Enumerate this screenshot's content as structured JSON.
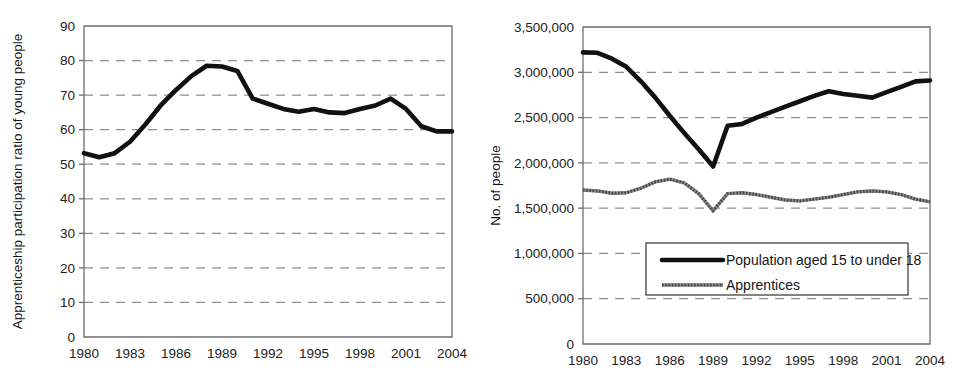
{
  "figure": {
    "background_color": "#ffffff",
    "ink_color": "#111111",
    "grid_color": "#8d8d8d",
    "axis_color": "#6e6e6e"
  },
  "chart_data": [
    {
      "id": "left",
      "type": "line",
      "title": "",
      "xlabel": "",
      "ylabel": "Apprenticeship participation ratio of young people",
      "xlim": [
        1980,
        2004
      ],
      "ylim": [
        0,
        90
      ],
      "ytick_labels": [
        "90",
        "80",
        "70",
        "60",
        "50",
        "40",
        "30",
        "20",
        "10",
        "0"
      ],
      "ytick_values": [
        90,
        80,
        70,
        60,
        50,
        40,
        30,
        20,
        10,
        0
      ],
      "xtick_labels": [
        "1980",
        "1983",
        "1986",
        "1989",
        "1992",
        "1995",
        "1998",
        "2001",
        "2004"
      ],
      "xtick_values": [
        1980,
        1983,
        1986,
        1989,
        1992,
        1995,
        1998,
        2001,
        2004
      ],
      "grid": "horizontal-dashed",
      "legend": "none",
      "x": [
        1980,
        1981,
        1982,
        1983,
        1984,
        1985,
        1986,
        1987,
        1988,
        1989,
        1990,
        1991,
        1992,
        1993,
        1994,
        1995,
        1996,
        1997,
        1998,
        1999,
        2000,
        2001,
        2002,
        2003,
        2004
      ],
      "series": [
        {
          "name": "Apprenticeship participation ratio of young people",
          "style": "thick-solid",
          "values": [
            53.2,
            52.0,
            53.2,
            56.5,
            61.5,
            67.0,
            71.5,
            75.5,
            78.5,
            78.3,
            77.0,
            69.0,
            67.5,
            66.0,
            65.2,
            66.0,
            65.0,
            64.8,
            66.0,
            67.0,
            69.0,
            66.0,
            61.0,
            59.5,
            59.5
          ]
        }
      ]
    },
    {
      "id": "right",
      "type": "line",
      "title": "",
      "xlabel": "",
      "ylabel": "No. of people",
      "xlim": [
        1980,
        2004
      ],
      "ylim": [
        0,
        3500000
      ],
      "ytick_labels": [
        "3,500,000",
        "3,000,000",
        "2,500,000",
        "2,000,000",
        "1,500,000",
        "1,000,000",
        "500,000",
        "0"
      ],
      "ytick_values": [
        3500000,
        3000000,
        2500000,
        2000000,
        1500000,
        1000000,
        500000,
        0
      ],
      "xtick_labels": [
        "1980",
        "1983",
        "1986",
        "1989",
        "1992",
        "1995",
        "1998",
        "2001",
        "2004"
      ],
      "xtick_values": [
        1980,
        1983,
        1986,
        1989,
        1992,
        1995,
        1998,
        2001,
        2004
      ],
      "grid": "horizontal-dashed",
      "legend": "inside-bottom-center",
      "x": [
        1980,
        1981,
        1982,
        1983,
        1984,
        1985,
        1986,
        1987,
        1988,
        1989,
        1990,
        1991,
        1992,
        1993,
        1994,
        1995,
        1996,
        1997,
        1998,
        1999,
        2000,
        2001,
        2002,
        2003,
        2004
      ],
      "series": [
        {
          "name": "Population aged 15 to under 18",
          "style": "thick-solid",
          "values": [
            3220000,
            3215000,
            3150000,
            3060000,
            2900000,
            2720000,
            2520000,
            2330000,
            2150000,
            1960000,
            2410000,
            2430000,
            2500000,
            2560000,
            2620000,
            2680000,
            2740000,
            2790000,
            2760000,
            2740000,
            2720000,
            2780000,
            2840000,
            2900000,
            2910000
          ]
        },
        {
          "name": "Apprentices",
          "style": "thin-hatched",
          "values": [
            1700000,
            1690000,
            1665000,
            1670000,
            1720000,
            1790000,
            1820000,
            1780000,
            1660000,
            1470000,
            1660000,
            1670000,
            1650000,
            1620000,
            1590000,
            1580000,
            1600000,
            1620000,
            1650000,
            1680000,
            1690000,
            1680000,
            1650000,
            1600000,
            1570000
          ]
        }
      ]
    }
  ],
  "legend": {
    "entries": [
      {
        "label": "Population aged 15 to under 18",
        "style": "thick-solid"
      },
      {
        "label": "Apprentices",
        "style": "thin-hatched"
      }
    ]
  }
}
